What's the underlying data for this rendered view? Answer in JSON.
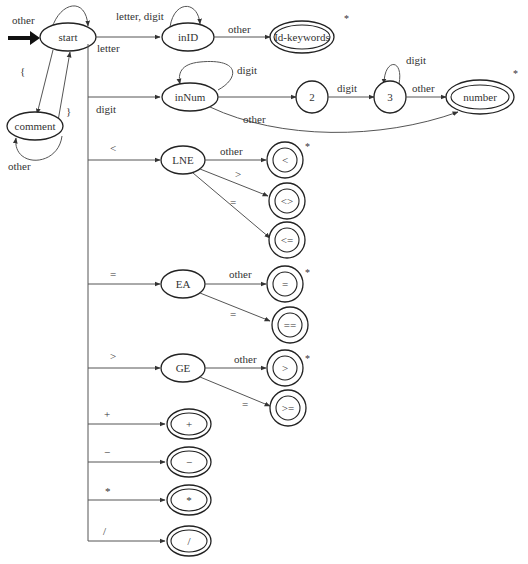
{
  "diagram": {
    "type": "state-transition-diagram (DFA lexer)",
    "start_arrow_label": "other",
    "nodes": {
      "start": "start",
      "comment": "comment",
      "inID": "inID",
      "id_keywords": "Id-keywords",
      "inNum": "inNum",
      "s2": "2",
      "s3": "3",
      "number": "number",
      "LNE": "LNE",
      "lt": "<",
      "ne": "<>",
      "le": "<=",
      "EA": "EA",
      "assign": "=",
      "eq": "==",
      "GE": "GE",
      "gt": ">",
      "ge": ">=",
      "plus": "+",
      "minus": "−",
      "times": "*",
      "div": "/"
    },
    "edges": {
      "start_to_comment": "{",
      "comment_to_start": "}",
      "comment_self": "other",
      "start_to_inID": "letter",
      "inID_self": "letter, digit",
      "inID_to_idkw": "other",
      "start_to_inNum": "digit",
      "inNum_self": "digit",
      "s2_to_s3": "digit",
      "s3_self": "digit",
      "s3_to_number": "other",
      "inNum_to_number": "other",
      "start_to_LNE": "<",
      "LNE_to_lt": "other",
      "LNE_to_ne": ">",
      "LNE_to_le": "=",
      "start_to_EA": "=",
      "EA_to_assign": "other",
      "EA_to_eq": "=",
      "start_to_GE": ">",
      "GE_to_gt": "other",
      "GE_to_ge": "=",
      "start_to_plus": "+",
      "start_to_minus": "−",
      "start_to_times": "*",
      "start_to_div": "/"
    },
    "retract_marker": "*"
  }
}
